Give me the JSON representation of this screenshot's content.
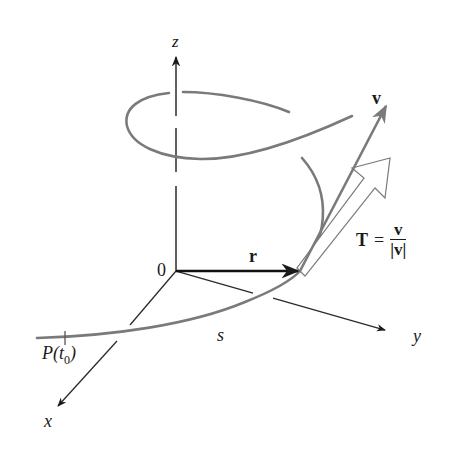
{
  "figure": {
    "colors": {
      "axis": "#2b2b2b",
      "curve": "#7a7a7a",
      "vector_r": "#111111",
      "vector_v": "#7a7a7a",
      "vector_T_outline": "#7a7a7a",
      "background": "#ffffff"
    },
    "axes": {
      "x_label": "x",
      "y_label": "y",
      "z_label": "z",
      "origin_label": "0"
    },
    "vectors": {
      "r_label": "r",
      "v_label": "v",
      "T_label": "T",
      "T_equals": "=",
      "T_numerator": "v",
      "T_denominator": "|v|"
    },
    "curve": {
      "arc_length_label": "s",
      "start_point_label": "P(t",
      "start_point_subscript": "0",
      "start_point_close": ")"
    }
  }
}
